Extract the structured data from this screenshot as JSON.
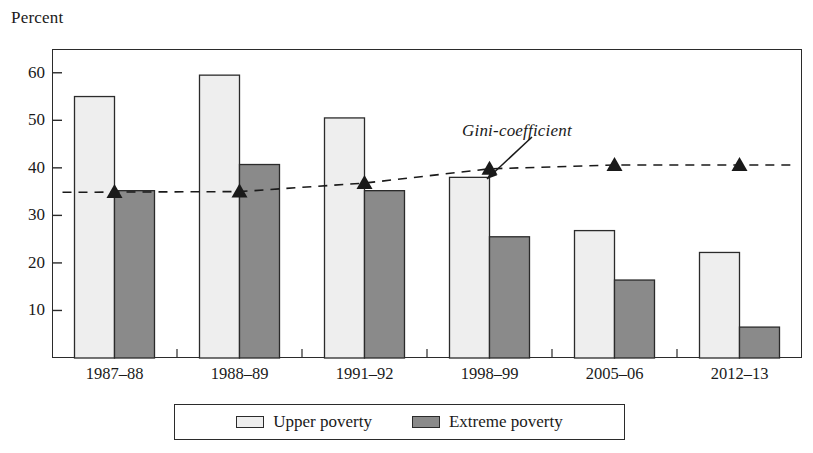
{
  "chart_data": {
    "type": "bar",
    "title": "",
    "subtitle": "",
    "xlabel": "",
    "ylabel": "Percent",
    "ylim": [
      0,
      65
    ],
    "yticks": [
      10,
      20,
      30,
      40,
      50,
      60
    ],
    "ytick_labels": [
      "10",
      "20",
      "30",
      "40",
      "50",
      "60"
    ],
    "grid": false,
    "legend_position": "bottom",
    "categories": [
      "1987–88",
      "1988–89",
      "1991–92",
      "1998–99",
      "2005–06",
      "2012–13"
    ],
    "series": [
      {
        "name": "Upper poverty",
        "type": "bar",
        "color": "#eeeeee",
        "edge_color": "#2b2b2b",
        "values": [
          55.0,
          59.5,
          50.5,
          38.0,
          26.8,
          22.2
        ]
      },
      {
        "name": "Extreme poverty",
        "type": "bar",
        "color": "#8a8a8a",
        "edge_color": "#2b2b2b",
        "values": [
          35.2,
          40.7,
          35.2,
          25.5,
          16.4,
          6.5
        ]
      },
      {
        "name": "Gini-coefficient",
        "type": "line",
        "style": "dashed",
        "marker": "triangle",
        "color": "#1a1a1a",
        "values": [
          34.9,
          35.0,
          36.8,
          39.8,
          40.6,
          40.6
        ]
      }
    ],
    "annotations": [
      {
        "text": "Gini-coefficient",
        "style": "italic",
        "points_to_series": "Gini-coefficient"
      }
    ]
  },
  "axis": {
    "y_title": "Percent"
  },
  "legend": {
    "items": [
      {
        "label": "Upper poverty",
        "swatch": "#eeeeee"
      },
      {
        "label": "Extreme poverty",
        "swatch": "#8a8a8a"
      }
    ]
  }
}
